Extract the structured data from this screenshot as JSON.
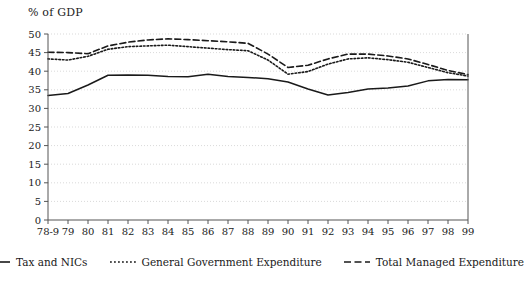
{
  "chart_data": {
    "type": "line",
    "title": "",
    "ylabel": "% of GDP",
    "xlabel": "",
    "ylim": [
      0,
      50
    ],
    "yticks": [
      0,
      5,
      10,
      15,
      20,
      25,
      30,
      35,
      40,
      45,
      50
    ],
    "grid": true,
    "legend_position": "bottom",
    "categories": [
      "78-9",
      "79",
      "80",
      "81",
      "82",
      "83",
      "84",
      "85",
      "86",
      "87",
      "88",
      "89",
      "90",
      "91",
      "92",
      "93",
      "94",
      "95",
      "96",
      "97",
      "98",
      "99"
    ],
    "series": [
      {
        "name": "Tax and NICs",
        "style": "solid",
        "color": "#1a1a1a",
        "values": [
          33.5,
          34.0,
          36.3,
          38.9,
          39.0,
          38.9,
          38.6,
          38.5,
          39.2,
          38.6,
          38.3,
          38.0,
          37.1,
          35.2,
          33.6,
          34.3,
          35.2,
          35.5,
          36.0,
          37.4,
          37.8,
          37.7
        ]
      },
      {
        "name": "General Government Expenditure",
        "style": "dotted",
        "color": "#1a1a1a",
        "values": [
          43.3,
          43.0,
          44.0,
          45.9,
          46.6,
          46.8,
          47.0,
          46.6,
          46.2,
          45.8,
          45.5,
          43.0,
          39.2,
          39.9,
          41.9,
          43.3,
          43.6,
          43.1,
          42.4,
          41.0,
          39.6,
          38.7
        ]
      },
      {
        "name": "Total Managed Expenditure",
        "style": "dashed",
        "color": "#1a1a1a",
        "values": [
          45.1,
          45.0,
          44.7,
          46.8,
          47.8,
          48.4,
          48.7,
          48.5,
          48.2,
          47.9,
          47.5,
          44.6,
          41.0,
          41.6,
          43.3,
          44.6,
          44.6,
          44.1,
          43.3,
          41.8,
          40.2,
          39.1
        ]
      }
    ]
  },
  "legend": {
    "items": [
      {
        "label": "Tax and NICs",
        "style": "solid"
      },
      {
        "label": "General Government Expenditure",
        "style": "dotted"
      },
      {
        "label": "Total Managed Expenditure",
        "style": "dashed"
      }
    ]
  },
  "colors": {
    "ink": "#1a1a1a",
    "grid": "#cfcfcf",
    "axis": "#555555",
    "background": "#ffffff"
  }
}
